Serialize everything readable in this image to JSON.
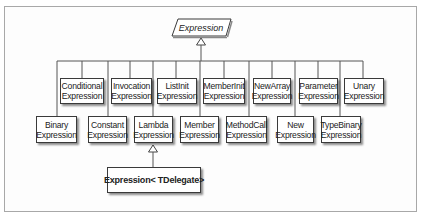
{
  "diagram": {
    "type": "class-hierarchy",
    "root": {
      "label": "Expression",
      "style": "abstract-italic-parallelogram"
    },
    "upper_row": [
      {
        "line1": "Conditional",
        "line2": "Expression"
      },
      {
        "line1": "Invocation",
        "line2": "Expression"
      },
      {
        "line1": "ListInit",
        "line2": "Expression"
      },
      {
        "line1": "MemberInit",
        "line2": "Expression"
      },
      {
        "line1": "NewArray",
        "line2": "Expression"
      },
      {
        "line1": "Parameter",
        "line2": "Expression"
      },
      {
        "line1": "Unary",
        "line2": "Expression"
      }
    ],
    "lower_row": [
      {
        "line1": "Binary",
        "line2": "Expression"
      },
      {
        "line1": "Constant",
        "line2": "Expression"
      },
      {
        "line1": "Lambda",
        "line2": "Expression"
      },
      {
        "line1": "Member",
        "line2": "Expression"
      },
      {
        "line1": "MethodCall",
        "line2": "Expression"
      },
      {
        "line1": "New",
        "line2": "Expression"
      },
      {
        "line1": "TypeBinary",
        "line2": "Expression"
      }
    ],
    "derived_from_lambda": {
      "label": "Expression< TDelegate>"
    },
    "colors": {
      "line": "#555555",
      "box_border": "#3a3a3a",
      "frame_border": "#a8a8a8",
      "text": "#222222"
    }
  }
}
